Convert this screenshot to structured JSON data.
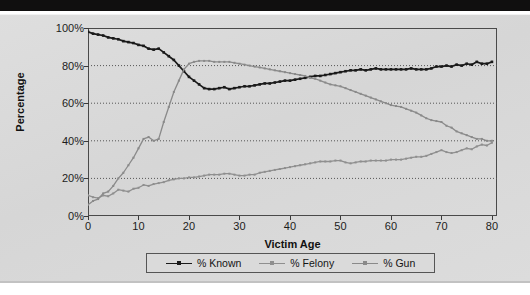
{
  "chart_data": {
    "type": "line",
    "title": "",
    "xlabel": "Victim Age",
    "ylabel": "Percentage",
    "xlim": [
      0,
      81
    ],
    "ylim": [
      0,
      100
    ],
    "grid": "horizontal-dotted",
    "legend_position": "bottom-center",
    "xticks": [
      0,
      10,
      20,
      30,
      40,
      50,
      60,
      70,
      80
    ],
    "xtick_labels": [
      "0",
      "10",
      "20",
      "30",
      "40",
      "50",
      "60",
      "70",
      "80"
    ],
    "yticks": [
      0,
      20,
      40,
      60,
      80,
      100
    ],
    "ytick_labels": [
      "0%",
      "20%",
      "40%",
      "60%",
      "80%",
      "100%"
    ],
    "x": [
      0,
      1,
      2,
      3,
      4,
      5,
      6,
      7,
      8,
      9,
      10,
      11,
      12,
      13,
      14,
      15,
      16,
      17,
      18,
      19,
      20,
      21,
      22,
      23,
      24,
      25,
      26,
      27,
      28,
      29,
      30,
      31,
      32,
      33,
      34,
      35,
      36,
      37,
      38,
      39,
      40,
      41,
      42,
      43,
      44,
      45,
      46,
      47,
      48,
      49,
      50,
      51,
      52,
      53,
      54,
      55,
      56,
      57,
      58,
      59,
      60,
      61,
      62,
      63,
      64,
      65,
      66,
      67,
      68,
      69,
      70,
      71,
      72,
      73,
      74,
      75,
      76,
      77,
      78,
      79,
      80
    ],
    "series": [
      {
        "name": "% Known",
        "color": "#1a1a1a",
        "marker": "square",
        "values": [
          98,
          97,
          96.5,
          96,
          95,
          94.5,
          94,
          93,
          92.5,
          92,
          91,
          90.5,
          89,
          88.5,
          89,
          87,
          85,
          83,
          80,
          77,
          74,
          72,
          70,
          68,
          67.5,
          67.5,
          68,
          68.5,
          67.5,
          68,
          68.5,
          69,
          69,
          69.5,
          70,
          70.5,
          70.5,
          71,
          71.5,
          72,
          72,
          72.5,
          73,
          73.5,
          74,
          74.5,
          74.5,
          75,
          75.5,
          76,
          76.5,
          77,
          77.5,
          77.5,
          78,
          77.5,
          78,
          78.5,
          78,
          78,
          78,
          78,
          78,
          78,
          78.5,
          78,
          78,
          78,
          78.5,
          79.5,
          79.5,
          80,
          79.5,
          80.5,
          80,
          81,
          80.5,
          82,
          81,
          81,
          82
        ]
      },
      {
        "name": "% Felony",
        "color": "#8f8f8f",
        "marker": "square",
        "values": [
          11,
          10,
          9.5,
          11,
          10.5,
          12,
          14,
          13.5,
          13,
          14.5,
          15,
          16.5,
          16,
          17,
          17.5,
          18,
          19,
          19.5,
          20,
          20,
          20.5,
          20.5,
          21,
          21.5,
          22,
          22,
          22,
          22.5,
          22.5,
          22,
          21.5,
          21.5,
          22,
          22,
          23,
          23.5,
          24,
          24.5,
          25,
          25.5,
          26,
          26.5,
          27,
          27.5,
          28,
          28.5,
          29,
          29,
          29,
          29.5,
          29.5,
          28.5,
          28,
          28.5,
          29,
          29,
          29.5,
          29.5,
          29.5,
          29.5,
          30,
          30,
          30,
          30.5,
          31,
          31.5,
          31.5,
          32,
          33,
          34,
          35,
          34,
          33.5,
          34,
          35,
          36,
          35.5,
          37,
          38,
          37.5,
          39
        ]
      },
      {
        "name": "% Gun",
        "color": "#8a8a8a",
        "marker": "square",
        "values": [
          6,
          8,
          9,
          12,
          13,
          16,
          20,
          23,
          27,
          31,
          36,
          41,
          42,
          40,
          41,
          50,
          58,
          66,
          72,
          78,
          81,
          82,
          82.5,
          82.5,
          82.5,
          82,
          82,
          82,
          82,
          81.5,
          81,
          80.5,
          80,
          79.5,
          79,
          78.5,
          78,
          77.5,
          77,
          76.5,
          76,
          75.5,
          75,
          74.5,
          73.5,
          73,
          72,
          71,
          70,
          69.5,
          69,
          68,
          67,
          66,
          65,
          64,
          63,
          62,
          61,
          60,
          59,
          58.5,
          58,
          57,
          56,
          55,
          53.5,
          52,
          51,
          50.5,
          50,
          48,
          47,
          45,
          44,
          43,
          42,
          41,
          41,
          40,
          40
        ]
      }
    ]
  },
  "legend": {
    "items": [
      {
        "label": "% Known"
      },
      {
        "label": "% Felony"
      },
      {
        "label": "% Gun"
      }
    ]
  },
  "axes": {
    "y_title": "Percentage",
    "x_title": "Victim Age"
  },
  "colors": {
    "known": "#1a1a1a",
    "felony": "#8f8f8f",
    "gun": "#8a8a8a",
    "panel_background": "#d9d9d9",
    "frame": "#4a4a4a",
    "gridline": "#555555"
  }
}
